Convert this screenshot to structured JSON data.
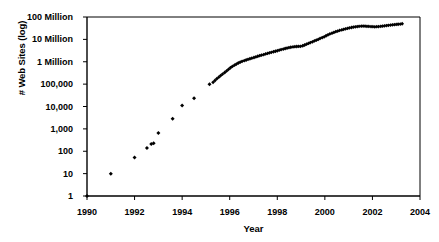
{
  "chart_data": {
    "type": "scatter",
    "title": "",
    "xlabel": "Year",
    "ylabel": "# Web Sites (log)",
    "xlim": [
      1990,
      2004
    ],
    "ylim": [
      1,
      100000000
    ],
    "yscale": "log",
    "grid": false,
    "legend": null,
    "xticks": [
      1990,
      1992,
      1994,
      1996,
      1998,
      2000,
      2002,
      2004
    ],
    "xtick_labels": [
      "1990",
      "1992",
      "1994",
      "1996",
      "1998",
      "2000",
      "2002",
      "2004"
    ],
    "yticks": [
      1,
      10,
      100,
      1000,
      10000,
      100000,
      1000000,
      10000000,
      100000000
    ],
    "ytick_labels": [
      "1",
      "10",
      "100",
      "1,000",
      "10,000",
      "100,000",
      "1 Million",
      "10 Million",
      "100 Million"
    ],
    "marker": "filled-diamond",
    "marker_color": "#000000",
    "series": [
      {
        "name": "# Web Sites",
        "x": [
          1990.0,
          1991.0,
          1992.0,
          1992.52,
          1992.7,
          1992.8,
          1993.0,
          1993.6,
          1994.0,
          1994.5,
          1995.15,
          1995.3,
          1995.38,
          1995.46,
          1995.54,
          1995.62,
          1995.7,
          1995.79,
          1995.87,
          1995.95,
          1996.03,
          1996.11,
          1996.2,
          1996.28,
          1996.36,
          1996.44,
          1996.52,
          1996.61,
          1996.69,
          1996.77,
          1996.85,
          1996.93,
          1997.02,
          1997.1,
          1997.18,
          1997.26,
          1997.34,
          1997.43,
          1997.51,
          1997.59,
          1997.67,
          1997.75,
          1997.84,
          1997.92,
          1998.0,
          1998.08,
          1998.16,
          1998.25,
          1998.33,
          1998.41,
          1998.49,
          1998.57,
          1998.66,
          1998.74,
          1998.82,
          1998.9,
          1998.98,
          1999.07,
          1999.15,
          1999.23,
          1999.31,
          1999.39,
          1999.48,
          1999.56,
          1999.64,
          1999.72,
          1999.8,
          1999.89,
          1999.97,
          2000.05,
          2000.13,
          2000.21,
          2000.3,
          2000.38,
          2000.46,
          2000.54,
          2000.62,
          2000.71,
          2000.79,
          2000.87,
          2000.95,
          2001.03,
          2001.12,
          2001.2,
          2001.28,
          2001.36,
          2001.44,
          2001.53,
          2001.61,
          2001.69,
          2001.77,
          2001.85,
          2001.94,
          2002.02,
          2002.1,
          2002.18,
          2002.26,
          2002.35,
          2002.43,
          2002.51,
          2002.59,
          2002.67,
          2002.76,
          2002.84,
          2002.92,
          2003.0,
          2003.08,
          2003.17,
          2003.25
        ],
        "y": [
          1,
          10,
          52,
          140,
          210,
          230,
          650,
          2800,
          11000,
          23500,
          100000,
          120000,
          145000,
          175000,
          205000,
          240000,
          280000,
          330000,
          390000,
          460000,
          540000,
          620000,
          700000,
          790000,
          880000,
          960000,
          1040000,
          1120000,
          1200000,
          1280000,
          1360000,
          1450000,
          1550000,
          1650000,
          1760000,
          1870000,
          1980000,
          2100000,
          2230000,
          2360000,
          2500000,
          2650000,
          2800000,
          2950000,
          3100000,
          3300000,
          3500000,
          3700000,
          3900000,
          4100000,
          4300000,
          4450000,
          4600000,
          4700000,
          4800000,
          4850000,
          4900000,
          5200000,
          5600000,
          6100000,
          6600000,
          7200000,
          7800000,
          8500000,
          9200000,
          10000000,
          11000000,
          12000000,
          13000000,
          14500000,
          16000000,
          17500000,
          19000000,
          20500000,
          22000000,
          23500000,
          25000000,
          26500000,
          28000000,
          29500000,
          31000000,
          32500000,
          34000000,
          35500000,
          36500000,
          37500000,
          38500000,
          39000000,
          39500000,
          39000000,
          38500000,
          38000000,
          37500000,
          37000000,
          36500000,
          37000000,
          37500000,
          38500000,
          39500000,
          40500000,
          41500000,
          42500000,
          43500000,
          44500000,
          45500000,
          46500000,
          47500000,
          48500000,
          50000000
        ]
      }
    ],
    "description_points": [
      {
        "year": 1990.0,
        "value": 1
      },
      {
        "year": 1991.0,
        "value": 10
      },
      {
        "year": 1992.0,
        "value": 52
      },
      {
        "year": 1993.0,
        "value": 650
      },
      {
        "year": 1994.0,
        "value": 11000
      },
      {
        "year": 1995.15,
        "value": 100000
      },
      {
        "year": 1996.0,
        "value": 500000
      },
      {
        "year": 1998.0,
        "value": 3100000
      },
      {
        "year": 2000.0,
        "value": 14500000
      },
      {
        "year": 2002.0,
        "value": 37000000
      },
      {
        "year": 2003.25,
        "value": 50000000
      }
    ]
  },
  "axes": {
    "frame_color": "#000000",
    "background": "#ffffff"
  }
}
